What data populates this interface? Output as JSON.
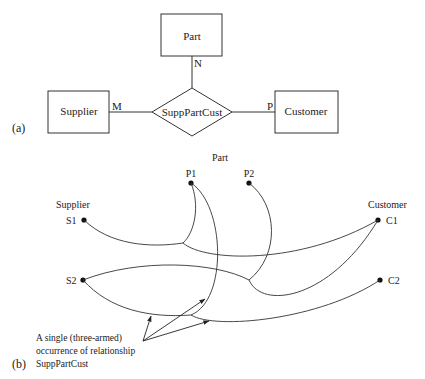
{
  "part_a": {
    "label": "(a)",
    "entities": {
      "part": "Part",
      "supplier": "Supplier",
      "customer": "Customer"
    },
    "relationship": "SuppPartCust",
    "cardinalities": {
      "supplier": "M",
      "part": "N",
      "customer": "P"
    }
  },
  "part_b": {
    "label": "(b)",
    "groups": {
      "part": "Part",
      "supplier": "Supplier",
      "customer": "Customer"
    },
    "nodes": {
      "p1": "P1",
      "p2": "P2",
      "s1": "S1",
      "s2": "S2",
      "c1": "C1",
      "c2": "C2"
    },
    "annotation": {
      "line1": "A single (three-armed)",
      "line2": "occurrence of relationship",
      "line3": "SuppPartCust"
    }
  }
}
